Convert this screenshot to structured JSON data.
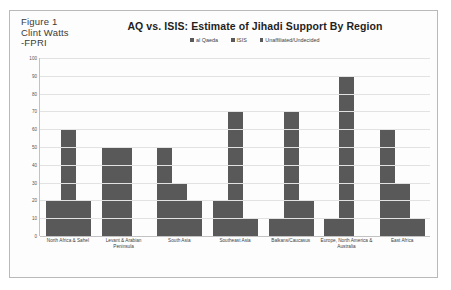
{
  "caption": {
    "line1": "Figure 1",
    "line2": "Clint Watts",
    "line3": "-FPRI"
  },
  "chart_data": {
    "type": "bar",
    "title": "AQ vs. ISIS: Estimate of Jihadi Support By Region",
    "xlabel": "",
    "ylabel": "",
    "ylim": [
      0,
      100
    ],
    "ytick_labels": [
      "100",
      "90",
      "80",
      "70",
      "60",
      "50",
      "40",
      "30",
      "20",
      "10",
      "0"
    ],
    "yticks": [
      100,
      90,
      80,
      70,
      60,
      50,
      40,
      30,
      20,
      10,
      0
    ],
    "grid": true,
    "legend_position": "top-center",
    "bar_color": "#595959",
    "categories": [
      "North Africa & Sahel",
      "Levant & Arabian Peninsula",
      "South Asia",
      "Southeast Asia",
      "Balkans/Caucasus",
      "Europe, North America & Australia",
      "East Africa"
    ],
    "series": [
      {
        "name": "al Qaeda",
        "color": "#595959",
        "values": [
          20,
          50,
          50,
          20,
          10,
          10,
          60
        ]
      },
      {
        "name": "ISIS",
        "color": "#595959",
        "values": [
          60,
          50,
          30,
          70,
          70,
          90,
          30
        ]
      },
      {
        "name": "Unaffiliated/Undecided",
        "color": "#595959",
        "values": [
          20,
          0,
          20,
          10,
          20,
          0,
          10
        ]
      }
    ]
  }
}
